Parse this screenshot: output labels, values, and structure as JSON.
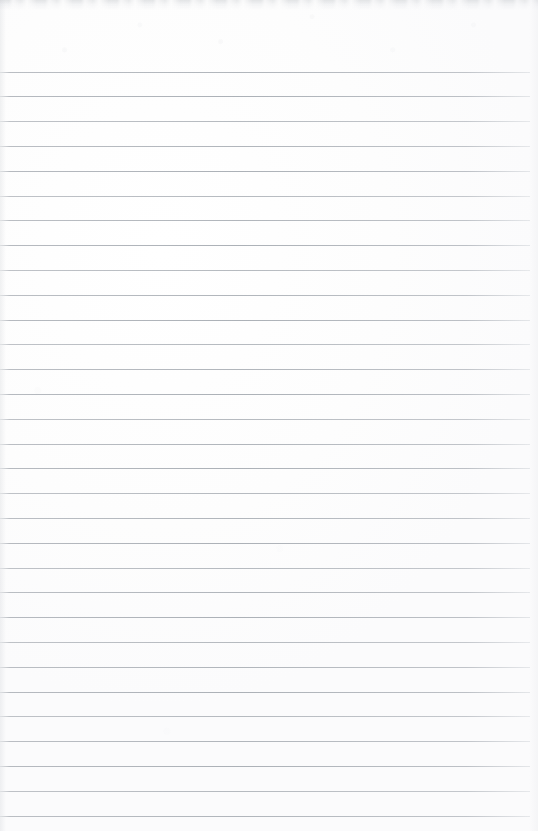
{
  "document": {
    "type": "scanned-blank-ruled-notepad-page",
    "title": "Blank Ruled Notepad Page",
    "page_width": 538,
    "page_height": 831,
    "background_color": "#fefefe",
    "has_text_content": false,
    "text_content": "",
    "handwriting_present": false,
    "margin_rule_present": false,
    "page_number": ""
  },
  "ruling": {
    "line_color": "#aeb3b9",
    "line_thickness": 1,
    "line_count": 31,
    "line_spacing": 24.8,
    "first_line_y": 71.6,
    "last_line_y": 816,
    "line_left_x": 0,
    "line_right_x": 530,
    "top_margin": 71.6,
    "bottom_margin": 15,
    "left_margin": 0,
    "right_margin": 8
  },
  "artifacts": {
    "top_edge_smudge": "gray scanner smudge band along top edge",
    "left_edge_shading": "faint vertical shading at left binding edge",
    "right_edge_shading": "faint vertical shading at right edge",
    "paper_grain": "subtle off-white mottling across the sheet"
  },
  "rule_lines": [
    {
      "y": 71.6,
      "x1": 0,
      "x2": 530
    },
    {
      "y": 96.4,
      "x1": 0,
      "x2": 530
    },
    {
      "y": 121.2,
      "x1": 0,
      "x2": 530
    },
    {
      "y": 146.0,
      "x1": 0,
      "x2": 530
    },
    {
      "y": 170.8,
      "x1": 0,
      "x2": 530
    },
    {
      "y": 195.6,
      "x1": 0,
      "x2": 530
    },
    {
      "y": 220.4,
      "x1": 0,
      "x2": 530
    },
    {
      "y": 245.2,
      "x1": 0,
      "x2": 530
    },
    {
      "y": 270.0,
      "x1": 0,
      "x2": 530
    },
    {
      "y": 294.8,
      "x1": 0,
      "x2": 530
    },
    {
      "y": 319.6,
      "x1": 0,
      "x2": 530
    },
    {
      "y": 344.4,
      "x1": 0,
      "x2": 530
    },
    {
      "y": 369.2,
      "x1": 0,
      "x2": 530
    },
    {
      "y": 394.0,
      "x1": 0,
      "x2": 530
    },
    {
      "y": 418.8,
      "x1": 0,
      "x2": 530
    },
    {
      "y": 443.6,
      "x1": 0,
      "x2": 530
    },
    {
      "y": 468.4,
      "x1": 0,
      "x2": 530
    },
    {
      "y": 493.2,
      "x1": 0,
      "x2": 530
    },
    {
      "y": 518.0,
      "x1": 0,
      "x2": 530
    },
    {
      "y": 542.8,
      "x1": 0,
      "x2": 530
    },
    {
      "y": 567.6,
      "x1": 0,
      "x2": 530
    },
    {
      "y": 592.4,
      "x1": 0,
      "x2": 530
    },
    {
      "y": 617.2,
      "x1": 0,
      "x2": 530
    },
    {
      "y": 642.0,
      "x1": 0,
      "x2": 530
    },
    {
      "y": 666.8,
      "x1": 0,
      "x2": 530
    },
    {
      "y": 691.6,
      "x1": 0,
      "x2": 530
    },
    {
      "y": 716.4,
      "x1": 0,
      "x2": 530
    },
    {
      "y": 741.2,
      "x1": 0,
      "x2": 530
    },
    {
      "y": 766.0,
      "x1": 0,
      "x2": 530
    },
    {
      "y": 790.8,
      "x1": 0,
      "x2": 530
    },
    {
      "y": 815.6,
      "x1": 0,
      "x2": 530
    }
  ]
}
